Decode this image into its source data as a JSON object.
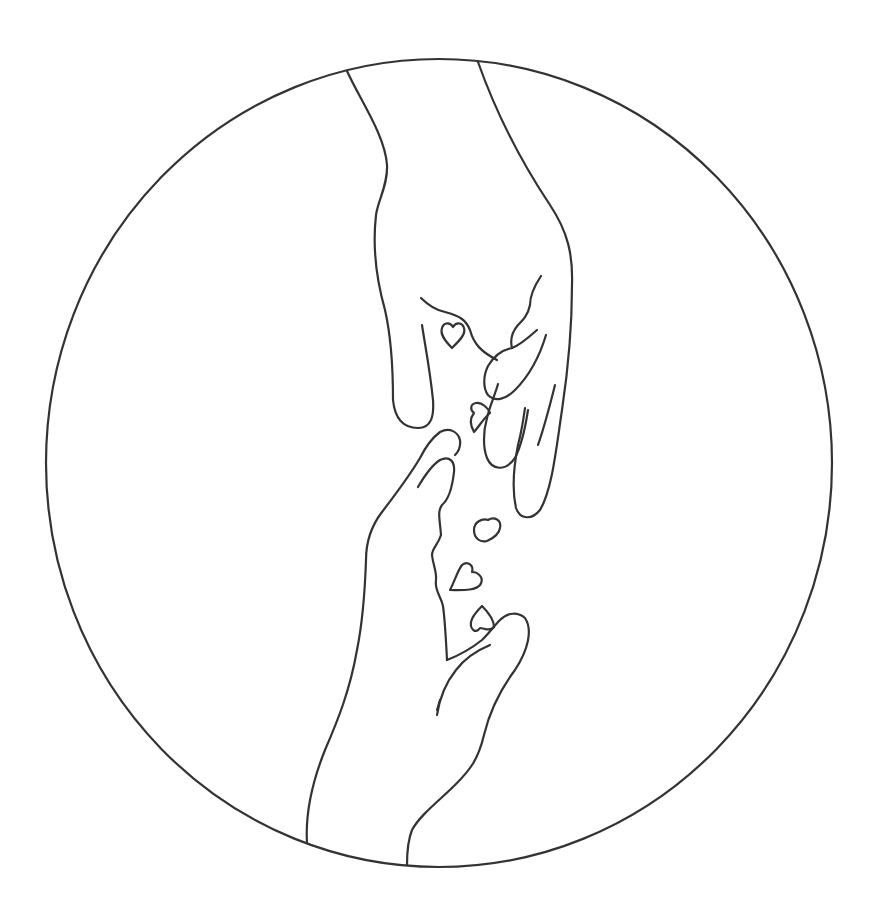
{
  "illustration": {
    "title": "Two hands reaching toward each other with hearts",
    "style": "single-weight line art",
    "colors": {
      "background": "#ffffff",
      "stroke": "#333333"
    },
    "frame": {
      "shape": "circle",
      "center": [
        439,
        463
      ],
      "radius_x": 393,
      "radius_y": 404
    },
    "elements": [
      {
        "name": "upper-hand",
        "description": "hand reaching down from top"
      },
      {
        "name": "lower-hand",
        "description": "hand reaching up from bottom"
      },
      {
        "name": "hearts",
        "count": 6
      }
    ]
  }
}
